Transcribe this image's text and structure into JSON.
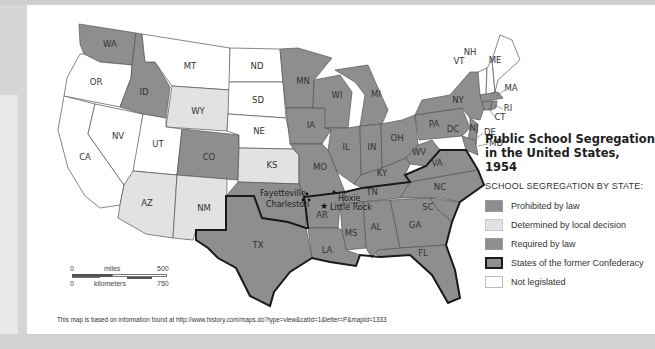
{
  "map": {
    "title_line1": "Public School Segregation",
    "title_line2": "in the United States, 1954",
    "legend_heading": "SCHOOL SEGREGATION BY STATE:",
    "legend": [
      {
        "label": "Prohibited by law",
        "color": "#8e8e8e",
        "border": "#9a9a9a"
      },
      {
        "label": "Determined by local decision",
        "color": "#e2e2e2",
        "border": "#c8c8c8"
      },
      {
        "label": "Required by law",
        "color": "#8e8e8e",
        "border": "#9a9a9a"
      },
      {
        "label": "States of the former Confederacy",
        "color": "#8e8e8e",
        "border": "#1a1a1a"
      },
      {
        "label": "Not legislated",
        "color": "#ffffff",
        "border": "#bbbbbb"
      }
    ],
    "states": {
      "prohibited": [
        "WA",
        "ID",
        "CO",
        "MN",
        "WI",
        "MI",
        "IA",
        "IL",
        "IN",
        "OH",
        "PA",
        "NY",
        "NJ",
        "MA",
        "RI",
        "CT"
      ],
      "local_decision": [
        "WY",
        "KS",
        "AZ",
        "NM"
      ],
      "required": [
        "MO",
        "KY",
        "WV",
        "MD",
        "DE",
        "DC",
        "VA",
        "NC",
        "SC",
        "GA",
        "FL",
        "AL",
        "MS",
        "LA",
        "AR",
        "TN",
        "TX",
        "OK"
      ],
      "not_legislated": [
        "OR",
        "CA",
        "NV",
        "UT",
        "MT",
        "ND",
        "SD",
        "NE",
        "VT",
        "NH",
        "ME"
      ]
    },
    "labels": {
      "WA": "WA",
      "OR": "OR",
      "CA": "CA",
      "NV": "NV",
      "ID": "ID",
      "MT": "MT",
      "WY": "WY",
      "UT": "UT",
      "CO": "CO",
      "AZ": "AZ",
      "NM": "NM",
      "ND": "ND",
      "SD": "SD",
      "NE": "NE",
      "KS": "KS",
      "TX": "TX",
      "MN": "MN",
      "IA": "IA",
      "MO": "MO",
      "AR": "AR",
      "LA": "LA",
      "WI": "WI",
      "IL": "IL",
      "MI": "MI",
      "IN": "IN",
      "OH": "OH",
      "KY": "KY",
      "TN": "TN",
      "MS": "MS",
      "AL": "AL",
      "GA": "GA",
      "FL": "FL",
      "SC": "SC",
      "NC": "NC",
      "VA": "VA",
      "WV": "WV",
      "PA": "PA",
      "NY": "NY",
      "DC": "DC",
      "NJ": "NJ",
      "DE": "DE",
      "MD": "MD",
      "CT": "CT",
      "RI": "RI",
      "MA": "MA",
      "VT": "VT",
      "NH": "NH",
      "ME": "ME"
    },
    "cities": [
      {
        "name": "Fayetteville",
        "marker": "dot"
      },
      {
        "name": "Charleston",
        "marker": "dot"
      },
      {
        "name": "Hoxie",
        "marker": "dot"
      },
      {
        "name": "Little Rock",
        "marker": "star"
      }
    ],
    "scale": {
      "miles_label": "miles",
      "km_label": "kilometers",
      "zero_miles": "0",
      "max_miles": "500",
      "zero_km": "0",
      "max_km": "750"
    },
    "source_note": "This map is based on information found at http://www.history.com/maps.do?type=view&catId=1&letter=P&mapId=1333"
  }
}
